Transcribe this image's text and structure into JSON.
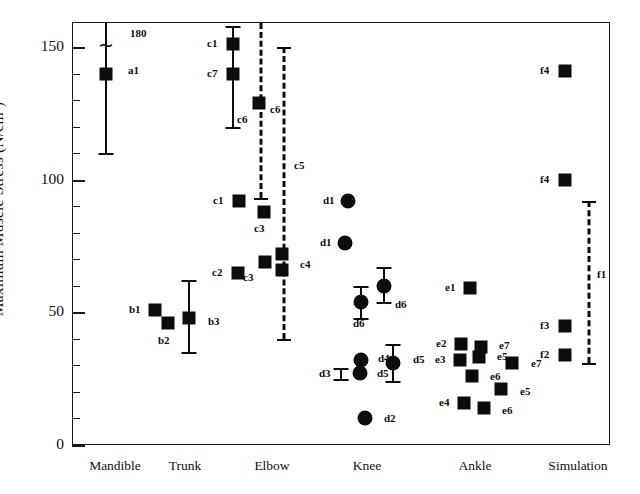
{
  "chart_data": {
    "type": "scatter",
    "title": "",
    "xlabel": "",
    "ylabel": "Maximum Muscle Stress   (N/cm2)",
    "ylabel_text": "Maximum Muscle Stress   (N/cm",
    "ylabel_sup": "2",
    "ylabel_tail": ")",
    "ylim": [
      0,
      160
    ],
    "yticks_major": [
      0,
      50,
      100,
      150
    ],
    "yticks_major_labels": [
      "0",
      "50",
      "100",
      "150"
    ],
    "yticks_minor": [
      10,
      20,
      30,
      40,
      60,
      70,
      80,
      90,
      110,
      120,
      130,
      140
    ],
    "grid": false,
    "legend": "none",
    "categories": [
      "Mandible",
      "Trunk",
      "Elbow",
      "Knee",
      "Ankle",
      "Simulation"
    ],
    "category_x_px": [
      115,
      185,
      272,
      367,
      475,
      578
    ],
    "annotations": [
      {
        "name": "upper-limit-180",
        "text": "180",
        "x": 130,
        "y": 28
      },
      {
        "name": "axis-break-tilde",
        "text": "~",
        "x": 106,
        "y": 45
      }
    ],
    "series": [
      {
        "name": "Mandible",
        "marker": "square",
        "points": [
          {
            "label": "a1",
            "x_px": 106,
            "value": 140,
            "err_low": 110,
            "err_high": 180,
            "err_truncated": true,
            "label_dx": 16,
            "label_dy": -4
          }
        ]
      },
      {
        "name": "Trunk",
        "marker": "square",
        "points": [
          {
            "label": "b1",
            "x_px": 155,
            "value": 51,
            "label_dx": -22,
            "label_dy": -1
          },
          {
            "label": "b2",
            "x_px": 168,
            "value": 46,
            "label_dx": -6,
            "label_dy": 17
          },
          {
            "label": "b3",
            "x_px": 189,
            "value": 48,
            "err_low": 35,
            "err_high": 62,
            "label_dx": 13,
            "label_dy": 3
          }
        ]
      },
      {
        "name": "Elbow",
        "marker": "square",
        "points": [
          {
            "label": "c1",
            "x_px": 233,
            "value": 151,
            "label_dx": -22,
            "label_dy": -1
          },
          {
            "label": "c7",
            "x_px": 233,
            "value": 140,
            "err_low": 120,
            "err_high": 158,
            "label_dx": -22,
            "label_dy": -1
          },
          {
            "label": "c6",
            "x_px": 259,
            "value": 129,
            "label_dx": -18,
            "label_dy": 16
          },
          {
            "label": "c1",
            "x_px": 239,
            "value": 92,
            "label_dx": -22,
            "label_dy": -1
          },
          {
            "label": "c3",
            "x_px": 264,
            "value": 88,
            "label_dx": -6,
            "label_dy": 16
          },
          {
            "label": "c4",
            "x_px": 282,
            "value": 72,
            "label_dx": 12,
            "label_dy": 10
          },
          {
            "label": "c3",
            "x_px": 265,
            "value": 69,
            "label_dx": -18,
            "label_dy": 15
          },
          {
            "label": "c2",
            "x_px": 238,
            "value": 65,
            "label_dx": -22,
            "label_dy": -1
          },
          {
            "label": "c3b",
            "x_px": 282,
            "value": 66,
            "label_dx": 0,
            "label_dy": 0,
            "hide_label": true
          }
        ],
        "range_bars": [
          {
            "label": "c6",
            "x_px": 261,
            "low": 93,
            "high": 160,
            "cap_low": true,
            "cap_high": false
          },
          {
            "label": "c5",
            "x_px": 284,
            "low": 40,
            "high": 150,
            "cap_low": true,
            "cap_high": true,
            "label_dx": 10,
            "label_dy": -28
          }
        ]
      },
      {
        "name": "Knee",
        "marker": "circle",
        "points": [
          {
            "label": "d1",
            "x_px": 348,
            "value": 92,
            "label_dx": -21,
            "label_dy": -1
          },
          {
            "label": "d1",
            "x_px": 345,
            "value": 76,
            "label_dx": -21,
            "label_dy": -1
          },
          {
            "label": "d6",
            "x_px": 361,
            "value": 54,
            "err_low": 48,
            "err_high": 60,
            "label_dx": -4,
            "label_dy": 21
          },
          {
            "label": "d6",
            "x_px": 384,
            "value": 60,
            "err_low": 54,
            "err_high": 67,
            "label_dx": 5,
            "label_dy": 18
          },
          {
            "label": "d4",
            "x_px": 361,
            "value": 32,
            "label_dx": 11,
            "label_dy": -2
          },
          {
            "label": "d5",
            "x_px": 360,
            "value": 27,
            "label_dx": 11,
            "label_dy": 0
          },
          {
            "label": "d5",
            "x_px": 393,
            "value": 31,
            "err_low": 24,
            "err_high": 38,
            "label_dx": 14,
            "label_dy": -4
          },
          {
            "label": "d2",
            "x_px": 365,
            "value": 10,
            "label_dx": 13,
            "label_dy": 0
          }
        ],
        "err_only": [
          {
            "label": "d3",
            "x_px": 341,
            "low": 25,
            "high": 29,
            "label_dx": -22,
            "label_dy": 0
          }
        ]
      },
      {
        "name": "Ankle",
        "marker": "square",
        "points": [
          {
            "label": "e1",
            "x_px": 470,
            "value": 59,
            "label_dx": -21,
            "label_dy": -1
          },
          {
            "label": "e2",
            "x_px": 461,
            "value": 38,
            "label_dx": -21,
            "label_dy": -1
          },
          {
            "label": "e7",
            "x_px": 481,
            "value": 37,
            "label_dx": 12,
            "label_dy": -2
          },
          {
            "label": "e3",
            "x_px": 460,
            "value": 32,
            "label_dx": -21,
            "label_dy": -1
          },
          {
            "label": "e5",
            "x_px": 479,
            "value": 33,
            "label_dx": 12,
            "label_dy": -1
          },
          {
            "label": "e7",
            "x_px": 512,
            "value": 31,
            "label_dx": 13,
            "label_dy": 0
          },
          {
            "label": "e6",
            "x_px": 472,
            "value": 26,
            "label_dx": 12,
            "label_dy": 0
          },
          {
            "label": "e5",
            "x_px": 501,
            "value": 21,
            "label_dx": 13,
            "label_dy": 2
          },
          {
            "label": "e4",
            "x_px": 464,
            "value": 16,
            "label_dx": -21,
            "label_dy": -1
          },
          {
            "label": "e6",
            "x_px": 484,
            "value": 14,
            "label_dx": 12,
            "label_dy": 2
          }
        ]
      },
      {
        "name": "Simulation",
        "marker": "square",
        "points": [
          {
            "label": "f4",
            "x_px": 565,
            "value": 141,
            "label_dx": -21,
            "label_dy": -1
          },
          {
            "label": "f4",
            "x_px": 565,
            "value": 100,
            "label_dx": -21,
            "label_dy": -1
          },
          {
            "label": "f3",
            "x_px": 565,
            "value": 45,
            "label_dx": -21,
            "label_dy": -1
          },
          {
            "label": "f2",
            "x_px": 565,
            "value": 34,
            "label_dx": -21,
            "label_dy": -1
          }
        ],
        "range_bars": [
          {
            "label": "f1",
            "x_px": 589,
            "low": 31,
            "high": 92,
            "cap_low": true,
            "cap_high": true,
            "label_dx": 8,
            "label_dy": -8
          }
        ]
      }
    ]
  }
}
